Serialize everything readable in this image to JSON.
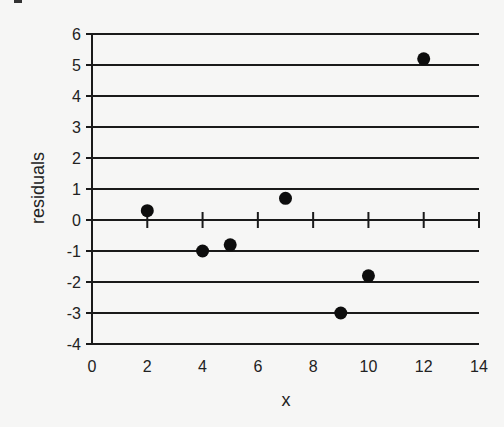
{
  "chart_data": {
    "type": "scatter",
    "title": "",
    "xlabel": "x",
    "ylabel": "residuals",
    "xlim": [
      0,
      14
    ],
    "ylim": [
      -4,
      6
    ],
    "x_ticks": [
      0,
      2,
      4,
      6,
      8,
      10,
      12,
      14
    ],
    "y_ticks": [
      -4,
      -3,
      -2,
      -1,
      0,
      1,
      2,
      3,
      4,
      5,
      6
    ],
    "grid": "horizontal",
    "legend": null,
    "series": [
      {
        "name": "residuals",
        "points": [
          {
            "x": 2,
            "y": 0.3
          },
          {
            "x": 4,
            "y": -1.0
          },
          {
            "x": 5,
            "y": -0.8
          },
          {
            "x": 7,
            "y": 0.7
          },
          {
            "x": 9,
            "y": -3.0
          },
          {
            "x": 10,
            "y": -1.8
          },
          {
            "x": 12,
            "y": 5.2
          }
        ]
      }
    ],
    "colors": {
      "background": "#f6f6f5",
      "lines": "#1a1a1a",
      "points": "#0d0d0d"
    }
  }
}
